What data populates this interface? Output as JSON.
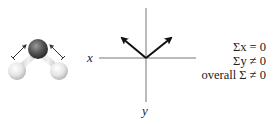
{
  "molecule": {
    "name": "water molecule (H2O) ball-and-stick model",
    "center_atom_color": "#555555",
    "outer_atom_color": "#e8e8e8",
    "bond_dipole_label_left": "+",
    "bond_dipole_label_right": "+"
  },
  "axes": {
    "x_label": "x",
    "y_label": "y"
  },
  "vectors": {
    "count": 2,
    "directions": [
      "up-left",
      "up-right"
    ],
    "color": "#111111"
  },
  "equations": {
    "line1": "Σx = 0",
    "line2": "Σy ≠ 0",
    "line3": "overall Σ ≠ 0"
  }
}
